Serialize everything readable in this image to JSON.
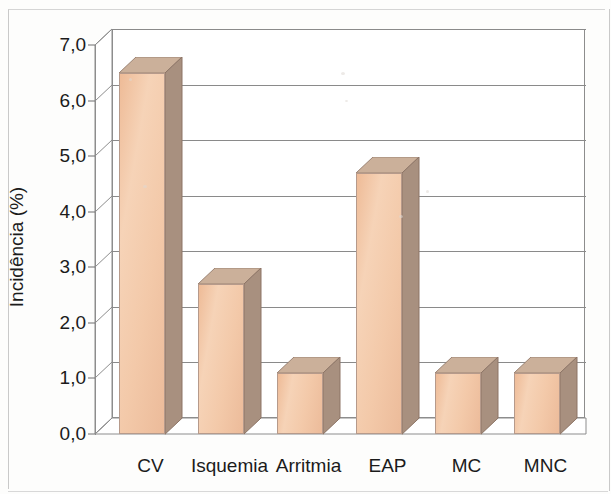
{
  "chart_data": {
    "type": "bar",
    "title": "",
    "subtitle": "",
    "xlabel": "",
    "ylabel": "Incidência (%)",
    "categories": [
      "CV",
      "Isquemia",
      "Arritmia",
      "EAP",
      "MC",
      "MNC"
    ],
    "values": [
      6.5,
      2.7,
      1.1,
      4.7,
      1.1,
      1.1
    ],
    "ylim": [
      0.0,
      7.0
    ],
    "ytick_labels": [
      "0,0",
      "1,0",
      "2,0",
      "3,0",
      "4,0",
      "5,0",
      "6,0",
      "7,0"
    ],
    "ytick_values": [
      0.0,
      1.0,
      2.0,
      3.0,
      4.0,
      5.0,
      6.0,
      7.0
    ],
    "grid": true,
    "legend": "none",
    "style": "3d-column",
    "bar_color": "#f3c9a9",
    "bar_side_color": "#a8907f",
    "bar_top_color": "#cbb09a",
    "grid_color": "#8a8a8a",
    "axis_color": "#8d8d8d",
    "text_color": "#1b1b1b",
    "decimal_separator": ","
  }
}
